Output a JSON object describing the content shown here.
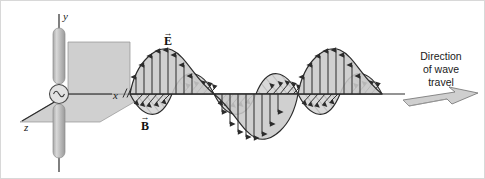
{
  "figure": {
    "background_color": "#ffffff",
    "frame_color": "#d8d8d8"
  },
  "axes": {
    "y_label": "y",
    "x_label": "x",
    "z_label": "z",
    "break_mark": "⫻",
    "axis_color": "#2b2b2b"
  },
  "antenna": {
    "rod_color": "#c2c2c2",
    "rod_edge_color": "#8d8d8d",
    "source_label": "ac-source",
    "source_symbol": "~",
    "plane_fill": "#cdcdcd",
    "plane_edge": "#8a8a8a"
  },
  "fields": {
    "electric": {
      "label": "E",
      "vector_bar": "→",
      "fill": "#c9c9c9",
      "stroke": "#2b2b2b",
      "arrow_style": "vertical"
    },
    "magnetic": {
      "label": "B",
      "vector_bar": "→",
      "fill": "#d5d5d5",
      "stroke": "#2b2b2b",
      "arrow_style": "diagonal"
    }
  },
  "direction_marker": {
    "caption_line1": "Direction",
    "caption_line2": "of wave",
    "caption_line3": "travel",
    "arrow_fill": "#cfcfcf",
    "arrow_edge": "#6f6f6f"
  }
}
